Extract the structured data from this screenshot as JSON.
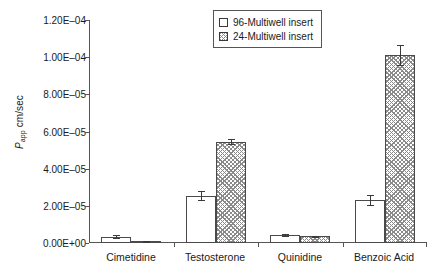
{
  "chart_data": {
    "type": "bar",
    "title": "",
    "xlabel": "",
    "ylabel": "Papp cm/sec",
    "ylabel_symbol": "P",
    "ylabel_subscript": "app",
    "ylabel_unit": " cm/sec",
    "categories": [
      "Cimetidine",
      "Testosterone",
      "Quinidine",
      "Benzoic Acid"
    ],
    "ylim": [
      0,
      0.00012
    ],
    "ytick_values": [
      0,
      2e-05,
      4e-05,
      6e-05,
      8e-05,
      0.0001,
      0.00012
    ],
    "ytick_labels": [
      "0.00E+00",
      "2.00E–05",
      "4.00E–05",
      "6.00E–05",
      "8.00E–05",
      "1.00E–04",
      "1.20E–04"
    ],
    "grid": false,
    "legend_position": "top-center",
    "series": [
      {
        "name": "96-Multiwell insert",
        "pattern": "open",
        "values": [
          3.5e-06,
          2.55e-05,
          4.3e-06,
          2.3e-05
        ],
        "errors": [
          7e-07,
          2.5e-06,
          3e-07,
          2.8e-06
        ]
      },
      {
        "name": "24-Multiwell insert",
        "pattern": "hatched",
        "values": [
          1e-06,
          5.45e-05,
          3.6e-06,
          0.0001012
        ],
        "errors": [
          2e-07,
          1.2e-06,
          3e-07,
          5.5e-06
        ]
      }
    ]
  },
  "legend": {
    "entries": [
      {
        "label": "96-Multiwell insert",
        "pattern": "open"
      },
      {
        "label": "24-Multiwell insert",
        "pattern": "hatched"
      }
    ]
  },
  "colors": {
    "axis": "#555555",
    "bar_outline": "#4a4a4a",
    "hatch": "#8a8a8a",
    "background": "#ffffff",
    "text": "#1a1a1a"
  }
}
